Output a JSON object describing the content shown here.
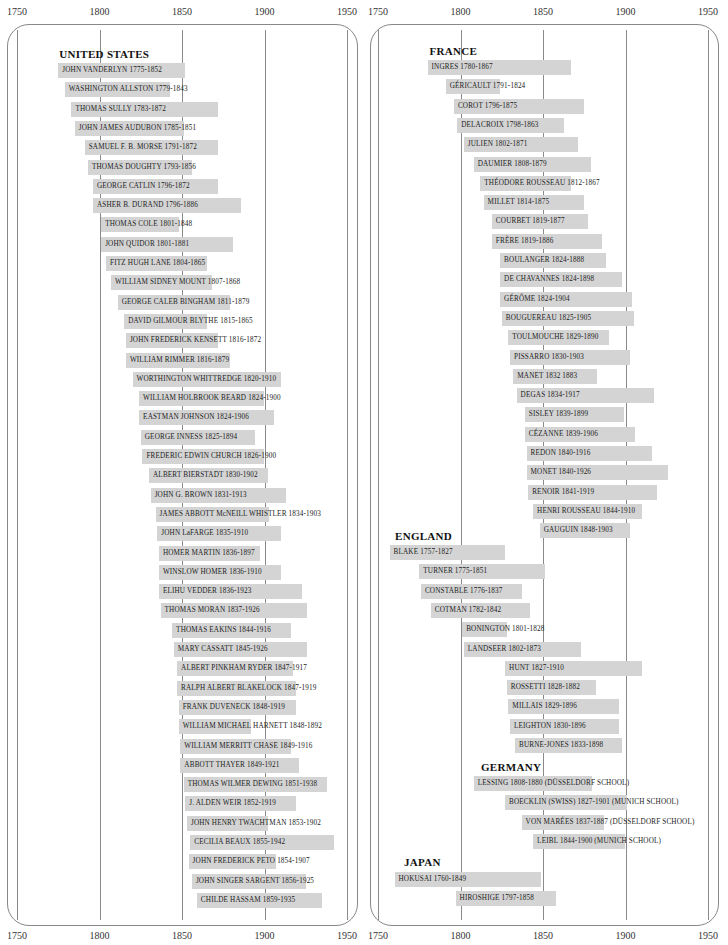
{
  "chart_data": {
    "type": "bar",
    "subtype": "timeline-gantt",
    "title": "",
    "xlabel": "",
    "ylabel": "",
    "xlim": [
      1750,
      1950
    ],
    "x_ticks": [
      1750,
      1800,
      1850,
      1900,
      1950
    ],
    "grid": true,
    "bar_color": "#d4d4d4",
    "panels": [
      {
        "id": "left",
        "groups": [
          {
            "title": "UNITED STATES",
            "artists": [
              {
                "label": "JOHN VANDERLYN 1775-1852",
                "start": 1775,
                "end": 1852
              },
              {
                "label": "WASHINGTON ALLSTON 1779-1843",
                "start": 1779,
                "end": 1843
              },
              {
                "label": "THOMAS SULLY 1783-1872",
                "start": 1783,
                "end": 1872
              },
              {
                "label": "JOHN JAMES AUDUBON 1785-1851",
                "start": 1785,
                "end": 1851
              },
              {
                "label": "SAMUEL F. B. MORSE 1791-1872",
                "start": 1791,
                "end": 1872
              },
              {
                "label": "THOMAS DOUGHTY 1793-1856",
                "start": 1793,
                "end": 1856
              },
              {
                "label": "GEORGE CATLIN 1796-1872",
                "start": 1796,
                "end": 1872
              },
              {
                "label": "ASHER B. DURAND 1796-1886",
                "start": 1796,
                "end": 1886
              },
              {
                "label": "THOMAS COLE 1801-1848",
                "start": 1801,
                "end": 1848
              },
              {
                "label": "JOHN QUIDOR 1801-1881",
                "start": 1801,
                "end": 1881
              },
              {
                "label": "FITZ HUGH LANE 1804-1865",
                "start": 1804,
                "end": 1865
              },
              {
                "label": "WILLIAM SIDNEY MOUNT 1807-1868",
                "start": 1807,
                "end": 1868
              },
              {
                "label": "GEORGE CALEB BINGHAM 1811-1879",
                "start": 1811,
                "end": 1879
              },
              {
                "label": "DAVID GILMOUR BLYTHE 1815-1865",
                "start": 1815,
                "end": 1865
              },
              {
                "label": "JOHN FREDERICK KENSETT 1816-1872",
                "start": 1816,
                "end": 1872
              },
              {
                "label": "WILLIAM RIMMER 1816-1879",
                "start": 1816,
                "end": 1879
              },
              {
                "label": "WORTHINGTON WHITTREDGE 1820-1910",
                "start": 1820,
                "end": 1910
              },
              {
                "label": "WILLIAM HOLBROOK BEARD 1824-1900",
                "start": 1824,
                "end": 1900
              },
              {
                "label": "EASTMAN JOHNSON 1824-1906",
                "start": 1824,
                "end": 1906
              },
              {
                "label": "GEORGE INNESS 1825-1894",
                "start": 1825,
                "end": 1894
              },
              {
                "label": "FREDERIC EDWIN CHURCH 1826-1900",
                "start": 1826,
                "end": 1900
              },
              {
                "label": "ALBERT BIERSTADT 1830-1902",
                "start": 1830,
                "end": 1902
              },
              {
                "label": "JOHN G. BROWN 1831-1913",
                "start": 1831,
                "end": 1913
              },
              {
                "label": "JAMES ABBOTT McNEILL WHISTLER 1834-1903",
                "start": 1834,
                "end": 1903
              },
              {
                "label": "JOHN LaFARGE 1835-1910",
                "start": 1835,
                "end": 1910
              },
              {
                "label": "HOMER MARTIN 1836-1897",
                "start": 1836,
                "end": 1897
              },
              {
                "label": "WINSLOW HOMER 1836-1910",
                "start": 1836,
                "end": 1910
              },
              {
                "label": "ELIHU VEDDER 1836-1923",
                "start": 1836,
                "end": 1923
              },
              {
                "label": "THOMAS MORAN 1837-1926",
                "start": 1837,
                "end": 1926
              },
              {
                "label": "THOMAS EAKINS 1844-1916",
                "start": 1844,
                "end": 1916
              },
              {
                "label": "MARY CASSATT 1845-1926",
                "start": 1845,
                "end": 1926
              },
              {
                "label": "ALBERT PINKHAM RYDER 1847-1917",
                "start": 1847,
                "end": 1917
              },
              {
                "label": "RALPH ALBERT BLAKELOCK 1847-1919",
                "start": 1847,
                "end": 1919
              },
              {
                "label": "FRANK DUVENECK 1848-1919",
                "start": 1848,
                "end": 1919
              },
              {
                "label": "WILLIAM MICHAEL HARNETT 1848-1892",
                "start": 1848,
                "end": 1892
              },
              {
                "label": "WILLIAM MERRITT CHASE 1849-1916",
                "start": 1849,
                "end": 1916
              },
              {
                "label": "ABBOTT THAYER 1849-1921",
                "start": 1849,
                "end": 1921
              },
              {
                "label": "THOMAS WILMER DEWING 1851-1938",
                "start": 1851,
                "end": 1938
              },
              {
                "label": "J. ALDEN WEIR 1852-1919",
                "start": 1852,
                "end": 1919
              },
              {
                "label": "JOHN HENRY TWACHTMAN 1853-1902",
                "start": 1853,
                "end": 1902
              },
              {
                "label": "CECILIA BEAUX 1855-1942",
                "start": 1855,
                "end": 1942
              },
              {
                "label": "JOHN FREDERICK PETO 1854-1907",
                "start": 1854,
                "end": 1907
              },
              {
                "label": "JOHN SINGER SARGENT 1856-1925",
                "start": 1856,
                "end": 1925
              },
              {
                "label": "CHILDE HASSAM 1859-1935",
                "start": 1859,
                "end": 1935
              }
            ]
          }
        ]
      },
      {
        "id": "right",
        "groups": [
          {
            "title": "FRANCE",
            "artists": [
              {
                "label": "INGRES 1780-1867",
                "start": 1780,
                "end": 1867
              },
              {
                "label": "GÉRICAULT 1791-1824",
                "start": 1791,
                "end": 1824
              },
              {
                "label": "COROT 1796-1875",
                "start": 1796,
                "end": 1875
              },
              {
                "label": "DELACROIX 1798-1863",
                "start": 1798,
                "end": 1863
              },
              {
                "label": "JULIEN 1802-1871",
                "start": 1802,
                "end": 1871
              },
              {
                "label": "DAUMIER 1808-1879",
                "start": 1808,
                "end": 1879
              },
              {
                "label": "THÉODORE ROUSSEAU 1812-1867",
                "start": 1812,
                "end": 1867
              },
              {
                "label": "MILLET 1814-1875",
                "start": 1814,
                "end": 1875
              },
              {
                "label": "COURBET 1819-1877",
                "start": 1819,
                "end": 1877
              },
              {
                "label": "FRÈRE 1819-1886",
                "start": 1819,
                "end": 1886
              },
              {
                "label": "BOULANGER 1824-1888",
                "start": 1824,
                "end": 1888
              },
              {
                "label": "DE CHAVANNES 1824-1898",
                "start": 1824,
                "end": 1898
              },
              {
                "label": "GÉRÔME 1824-1904",
                "start": 1824,
                "end": 1904
              },
              {
                "label": "BOUGUEREAU 1825-1905",
                "start": 1825,
                "end": 1905
              },
              {
                "label": "TOULMOUCHE 1829-1890",
                "start": 1829,
                "end": 1890
              },
              {
                "label": "PISSARRO 1830-1903",
                "start": 1830,
                "end": 1903
              },
              {
                "label": "MANET 1832 1883",
                "start": 1832,
                "end": 1883
              },
              {
                "label": "DEGAS 1834-1917",
                "start": 1834,
                "end": 1917
              },
              {
                "label": "SISLEY 1839-1899",
                "start": 1839,
                "end": 1899
              },
              {
                "label": "CÉZANNE 1839-1906",
                "start": 1839,
                "end": 1906
              },
              {
                "label": "REDON 1840-1916",
                "start": 1840,
                "end": 1916
              },
              {
                "label": "MONET 1840-1926",
                "start": 1840,
                "end": 1926
              },
              {
                "label": "RENOIR 1841-1919",
                "start": 1841,
                "end": 1919
              },
              {
                "label": "HENRI ROUSSEAU 1844-1910",
                "start": 1844,
                "end": 1910
              },
              {
                "label": "GAUGUIN 1848-1903",
                "start": 1848,
                "end": 1903
              }
            ]
          },
          {
            "title": "ENGLAND",
            "artists": [
              {
                "label": "BLAKE 1757-1827",
                "start": 1757,
                "end": 1827
              },
              {
                "label": "TURNER 1775-1851",
                "start": 1775,
                "end": 1851
              },
              {
                "label": "CONSTABLE 1776-1837",
                "start": 1776,
                "end": 1837
              },
              {
                "label": "COTMAN 1782-1842",
                "start": 1782,
                "end": 1842
              },
              {
                "label": "BONINGTON 1801-1828",
                "start": 1801,
                "end": 1828
              },
              {
                "label": "LANDSEER 1802-1873",
                "start": 1802,
                "end": 1873
              },
              {
                "label": "HUNT 1827-1910",
                "start": 1827,
                "end": 1910
              },
              {
                "label": "ROSSETTI 1828-1882",
                "start": 1828,
                "end": 1882
              },
              {
                "label": "MILLAIS 1829-1896",
                "start": 1829,
                "end": 1896
              },
              {
                "label": "LEIGHTON 1830-1896",
                "start": 1830,
                "end": 1896
              },
              {
                "label": "BURNE-JONES 1833-1898",
                "start": 1833,
                "end": 1898
              }
            ]
          },
          {
            "title": "GERMANY",
            "artists": [
              {
                "label": "LESSING 1808-1880 (DÜSSELDORF SCHOOL)",
                "start": 1808,
                "end": 1880
              },
              {
                "label": "BOECKLIN (SWISS) 1827-1901 (MUNICH SCHOOL)",
                "start": 1827,
                "end": 1901
              },
              {
                "label": "VON MARÉES 1837-1887 (DÜSSELDORF SCHOOL)",
                "start": 1837,
                "end": 1887
              },
              {
                "label": "LEIBL 1844-1900 (MUNICH SCHOOL)",
                "start": 1844,
                "end": 1900
              }
            ]
          },
          {
            "title": "JAPAN",
            "artists": [
              {
                "label": "HOKUSAI 1760-1849",
                "start": 1760,
                "end": 1849
              },
              {
                "label": "HIROSHIGE 1797-1858",
                "start": 1797,
                "end": 1858
              }
            ]
          }
        ]
      }
    ]
  },
  "axes": {
    "left": {
      "top_labels": [
        "1750",
        "1800",
        "1850",
        "1900",
        "1950"
      ],
      "bottom_labels": [
        "1750",
        "1800",
        "1850",
        "1900",
        "1950"
      ]
    },
    "right": {
      "top_labels": [
        "1750",
        "1800",
        "1850",
        "1900",
        "1950"
      ],
      "bottom_labels": [
        "1750",
        "1800",
        "1850",
        "1900",
        "1950"
      ]
    }
  }
}
